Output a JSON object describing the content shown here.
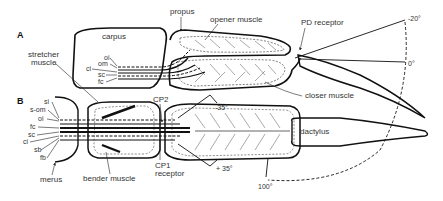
{
  "panels": {
    "a": {
      "letter": "A",
      "labels": {
        "carpus": "carpus",
        "propus": "propus",
        "opener_muscle": "opener muscle",
        "pd_receptor": "PD receptor",
        "closer_muscle": "closer muscle",
        "stretcher_muscle_1": "stretcher",
        "stretcher_muscle_2": "muscle",
        "oi": "oi",
        "om": "om",
        "ci": "ci",
        "sc": "sc",
        "fc": "fc"
      },
      "angles": {
        "minus20": "-20°",
        "zero": "0°"
      }
    },
    "b": {
      "letter": "B",
      "labels": {
        "si": "si",
        "s_om": "s-om",
        "oi": "oi",
        "fc": "fc",
        "sc": "sc",
        "ci": "ci",
        "sb": "sb",
        "fb": "fb",
        "merus": "merus",
        "bender_muscle": "bender muscle",
        "cp2": "CP2",
        "cp1_1": "CP1",
        "cp1_2": "receptor",
        "dactylus": "dactylus"
      },
      "angles": {
        "minus35": "-35°",
        "plus35": "+ 35°",
        "hundred": "100°"
      }
    }
  }
}
